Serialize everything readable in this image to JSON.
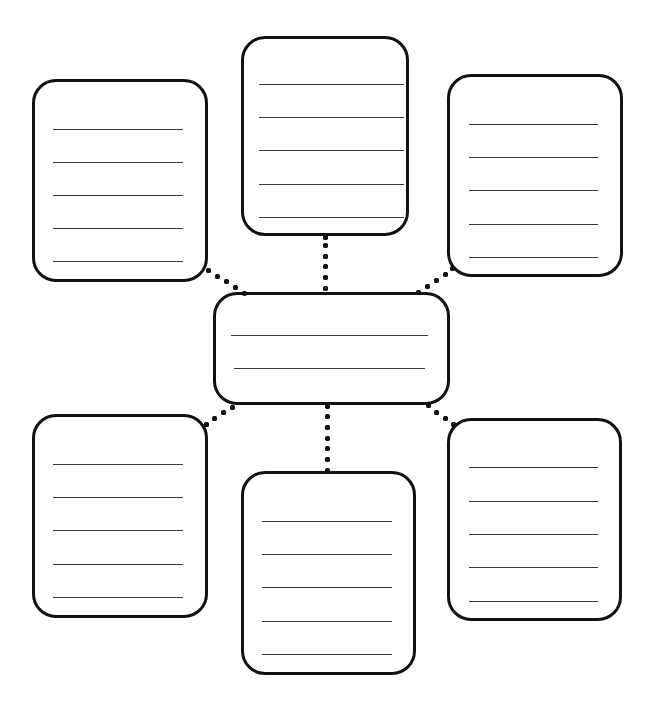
{
  "diagram": {
    "type": "spider-map-graphic-organizer",
    "colors": {
      "background": "#ffffff",
      "stroke": "#111111",
      "writing_line": "#3a3a3a"
    },
    "center": {
      "id": "center",
      "x": 213,
      "y": 292,
      "w": 237,
      "h": 113,
      "lines": [
        {
          "x1": 231,
          "x2": 428,
          "y": 335
        },
        {
          "x1": 234,
          "x2": 425,
          "y": 368
        }
      ]
    },
    "branches": [
      {
        "id": "top-left",
        "x": 32,
        "y": 79,
        "w": 176,
        "h": 203,
        "lines": [
          {
            "x1": 53,
            "x2": 183,
            "y": 129
          },
          {
            "x1": 53,
            "x2": 183,
            "y": 162
          },
          {
            "x1": 53,
            "x2": 183,
            "y": 195
          },
          {
            "x1": 53,
            "x2": 183,
            "y": 228
          },
          {
            "x1": 53,
            "x2": 183,
            "y": 261
          }
        ],
        "connector": [
          [
            208,
            270
          ],
          [
            217,
            276
          ],
          [
            226,
            281
          ],
          [
            235,
            287
          ],
          [
            244,
            293
          ]
        ]
      },
      {
        "id": "top-center",
        "x": 241,
        "y": 36,
        "w": 168,
        "h": 200,
        "lines": [
          {
            "x1": 259,
            "x2": 404,
            "y": 84
          },
          {
            "x1": 259,
            "x2": 404,
            "y": 117
          },
          {
            "x1": 259,
            "x2": 404,
            "y": 150
          },
          {
            "x1": 259,
            "x2": 404,
            "y": 184
          },
          {
            "x1": 259,
            "x2": 404,
            "y": 217
          }
        ],
        "connector": [
          [
            325,
            237
          ],
          [
            325,
            245
          ],
          [
            325,
            256
          ],
          [
            325,
            266
          ],
          [
            325,
            277
          ],
          [
            325,
            288
          ]
        ]
      },
      {
        "id": "top-right",
        "x": 447,
        "y": 74,
        "w": 176,
        "h": 203,
        "lines": [
          {
            "x1": 469,
            "x2": 598,
            "y": 124
          },
          {
            "x1": 469,
            "x2": 598,
            "y": 157
          },
          {
            "x1": 469,
            "x2": 598,
            "y": 190
          },
          {
            "x1": 469,
            "x2": 598,
            "y": 224
          },
          {
            "x1": 469,
            "x2": 598,
            "y": 257
          }
        ],
        "connector": [
          [
            418,
            292
          ],
          [
            427,
            286
          ],
          [
            436,
            280
          ],
          [
            445,
            274
          ],
          [
            452,
            268
          ]
        ]
      },
      {
        "id": "bottom-left",
        "x": 32,
        "y": 414,
        "w": 176,
        "h": 204,
        "lines": [
          {
            "x1": 53,
            "x2": 183,
            "y": 464
          },
          {
            "x1": 53,
            "x2": 183,
            "y": 497
          },
          {
            "x1": 53,
            "x2": 183,
            "y": 530
          },
          {
            "x1": 53,
            "x2": 183,
            "y": 564
          },
          {
            "x1": 53,
            "x2": 183,
            "y": 597
          }
        ],
        "connector": [
          [
            232,
            407
          ],
          [
            223,
            412
          ],
          [
            214,
            418
          ],
          [
            206,
            424
          ]
        ]
      },
      {
        "id": "bottom-center",
        "x": 241,
        "y": 471,
        "w": 175,
        "h": 204,
        "lines": [
          {
            "x1": 262,
            "x2": 392,
            "y": 521
          },
          {
            "x1": 262,
            "x2": 392,
            "y": 554
          },
          {
            "x1": 262,
            "x2": 392,
            "y": 587
          },
          {
            "x1": 262,
            "x2": 392,
            "y": 621
          },
          {
            "x1": 262,
            "x2": 392,
            "y": 654
          }
        ],
        "connector": [
          [
            327,
            406
          ],
          [
            327,
            416
          ],
          [
            327,
            427
          ],
          [
            327,
            438
          ],
          [
            327,
            448
          ],
          [
            327,
            459
          ],
          [
            327,
            470
          ]
        ]
      },
      {
        "id": "bottom-right",
        "x": 447,
        "y": 418,
        "w": 175,
        "h": 203,
        "lines": [
          {
            "x1": 469,
            "x2": 598,
            "y": 467
          },
          {
            "x1": 469,
            "x2": 598,
            "y": 501
          },
          {
            "x1": 469,
            "x2": 598,
            "y": 534
          },
          {
            "x1": 469,
            "x2": 598,
            "y": 567
          },
          {
            "x1": 469,
            "x2": 598,
            "y": 601
          }
        ],
        "connector": [
          [
            428,
            405
          ],
          [
            436,
            412
          ],
          [
            445,
            418
          ],
          [
            453,
            424
          ]
        ]
      }
    ]
  }
}
